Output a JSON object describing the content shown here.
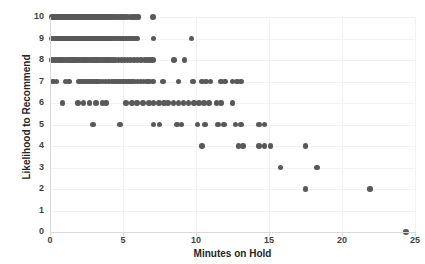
{
  "chart_data": {
    "type": "scatter",
    "title": "",
    "xlabel": "Minutes on Hold",
    "ylabel": "Likelihood to Recommend",
    "xlim": [
      0,
      25
    ],
    "ylim": [
      0,
      10
    ],
    "xticks": [
      0,
      5,
      10,
      15,
      20,
      25
    ],
    "yticks": [
      0,
      1,
      2,
      3,
      4,
      5,
      6,
      7,
      8,
      9,
      10
    ],
    "grid": true,
    "legend": false,
    "marker_color": "#595959",
    "series": [
      {
        "name": "Respondents",
        "points": [
          [
            0.12,
            10
          ],
          [
            0.25,
            10
          ],
          [
            0.35,
            10
          ],
          [
            0.45,
            10
          ],
          [
            0.55,
            10
          ],
          [
            0.65,
            10
          ],
          [
            0.75,
            10
          ],
          [
            0.85,
            10
          ],
          [
            0.95,
            10
          ],
          [
            1.05,
            10
          ],
          [
            1.15,
            10
          ],
          [
            1.25,
            10
          ],
          [
            1.35,
            10
          ],
          [
            1.45,
            10
          ],
          [
            1.55,
            10
          ],
          [
            1.65,
            10
          ],
          [
            1.75,
            10
          ],
          [
            1.85,
            10
          ],
          [
            1.95,
            10
          ],
          [
            2.05,
            10
          ],
          [
            2.15,
            10
          ],
          [
            2.25,
            10
          ],
          [
            2.35,
            10
          ],
          [
            2.45,
            10
          ],
          [
            2.55,
            10
          ],
          [
            2.65,
            10
          ],
          [
            2.75,
            10
          ],
          [
            2.85,
            10
          ],
          [
            2.95,
            10
          ],
          [
            3.05,
            10
          ],
          [
            3.15,
            10
          ],
          [
            3.25,
            10
          ],
          [
            3.35,
            10
          ],
          [
            3.45,
            10
          ],
          [
            3.55,
            10
          ],
          [
            3.65,
            10
          ],
          [
            3.75,
            10
          ],
          [
            3.85,
            10
          ],
          [
            3.95,
            10
          ],
          [
            4.05,
            10
          ],
          [
            4.15,
            10
          ],
          [
            4.25,
            10
          ],
          [
            4.4,
            10
          ],
          [
            4.55,
            10
          ],
          [
            4.7,
            10
          ],
          [
            4.85,
            10
          ],
          [
            5.0,
            10
          ],
          [
            5.15,
            10
          ],
          [
            5.3,
            10
          ],
          [
            5.5,
            10
          ],
          [
            5.7,
            10
          ],
          [
            5.9,
            10
          ],
          [
            6.05,
            10
          ],
          [
            7.05,
            10
          ],
          [
            0.15,
            9
          ],
          [
            0.3,
            9
          ],
          [
            0.4,
            9
          ],
          [
            0.5,
            9
          ],
          [
            0.6,
            9
          ],
          [
            0.7,
            9
          ],
          [
            0.8,
            9
          ],
          [
            0.9,
            9
          ],
          [
            1.0,
            9
          ],
          [
            1.1,
            9
          ],
          [
            1.2,
            9
          ],
          [
            1.3,
            9
          ],
          [
            1.4,
            9
          ],
          [
            1.5,
            9
          ],
          [
            1.6,
            9
          ],
          [
            1.7,
            9
          ],
          [
            1.8,
            9
          ],
          [
            1.9,
            9
          ],
          [
            2.0,
            9
          ],
          [
            2.1,
            9
          ],
          [
            2.2,
            9
          ],
          [
            2.3,
            9
          ],
          [
            2.4,
            9
          ],
          [
            2.5,
            9
          ],
          [
            2.6,
            9
          ],
          [
            2.7,
            9
          ],
          [
            2.8,
            9
          ],
          [
            2.9,
            9
          ],
          [
            3.0,
            9
          ],
          [
            3.1,
            9
          ],
          [
            3.2,
            9
          ],
          [
            3.3,
            9
          ],
          [
            3.4,
            9
          ],
          [
            3.5,
            9
          ],
          [
            3.6,
            9
          ],
          [
            3.7,
            9
          ],
          [
            3.8,
            9
          ],
          [
            3.9,
            9
          ],
          [
            4.0,
            9
          ],
          [
            4.1,
            9
          ],
          [
            4.25,
            9
          ],
          [
            4.45,
            9
          ],
          [
            4.65,
            9
          ],
          [
            4.85,
            9
          ],
          [
            5.0,
            9
          ],
          [
            5.2,
            9
          ],
          [
            5.4,
            9
          ],
          [
            5.6,
            9
          ],
          [
            5.8,
            9
          ],
          [
            5.95,
            9
          ],
          [
            7.1,
            9
          ],
          [
            9.7,
            9
          ],
          [
            0.15,
            8
          ],
          [
            0.3,
            8
          ],
          [
            0.45,
            8
          ],
          [
            0.6,
            8
          ],
          [
            0.75,
            8
          ],
          [
            0.9,
            8
          ],
          [
            1.05,
            8
          ],
          [
            1.2,
            8
          ],
          [
            1.35,
            8
          ],
          [
            1.5,
            8
          ],
          [
            1.65,
            8
          ],
          [
            1.8,
            8
          ],
          [
            1.95,
            8
          ],
          [
            2.1,
            8
          ],
          [
            2.25,
            8
          ],
          [
            2.4,
            8
          ],
          [
            2.55,
            8
          ],
          [
            2.7,
            8
          ],
          [
            2.85,
            8
          ],
          [
            3.0,
            8
          ],
          [
            3.15,
            8
          ],
          [
            3.3,
            8
          ],
          [
            3.45,
            8
          ],
          [
            3.6,
            8
          ],
          [
            3.75,
            8
          ],
          [
            3.9,
            8
          ],
          [
            4.05,
            8
          ],
          [
            4.2,
            8
          ],
          [
            4.35,
            8
          ],
          [
            4.5,
            8
          ],
          [
            4.7,
            8
          ],
          [
            4.9,
            8
          ],
          [
            5.1,
            8
          ],
          [
            5.3,
            8
          ],
          [
            5.5,
            8
          ],
          [
            5.75,
            8
          ],
          [
            6.0,
            8
          ],
          [
            6.25,
            8
          ],
          [
            6.5,
            8
          ],
          [
            6.7,
            8
          ],
          [
            6.9,
            8
          ],
          [
            7.05,
            8
          ],
          [
            8.5,
            8
          ],
          [
            9.2,
            8
          ],
          [
            0.2,
            7
          ],
          [
            0.45,
            7
          ],
          [
            1.05,
            7
          ],
          [
            1.3,
            7
          ],
          [
            2.0,
            7
          ],
          [
            2.2,
            7
          ],
          [
            2.4,
            7
          ],
          [
            2.6,
            7
          ],
          [
            2.8,
            7
          ],
          [
            3.0,
            7
          ],
          [
            3.2,
            7
          ],
          [
            3.4,
            7
          ],
          [
            3.6,
            7
          ],
          [
            3.8,
            7
          ],
          [
            4.0,
            7
          ],
          [
            4.2,
            7
          ],
          [
            4.4,
            7
          ],
          [
            4.6,
            7
          ],
          [
            4.8,
            7
          ],
          [
            5.0,
            7
          ],
          [
            5.2,
            7
          ],
          [
            5.4,
            7
          ],
          [
            5.6,
            7
          ],
          [
            5.8,
            7
          ],
          [
            6.0,
            7
          ],
          [
            6.2,
            7
          ],
          [
            6.4,
            7
          ],
          [
            6.6,
            7
          ],
          [
            6.8,
            7
          ],
          [
            7.05,
            7
          ],
          [
            7.75,
            7
          ],
          [
            8.8,
            7
          ],
          [
            9.8,
            7
          ],
          [
            10.4,
            7
          ],
          [
            10.7,
            7
          ],
          [
            11.0,
            7
          ],
          [
            11.7,
            7
          ],
          [
            12.0,
            7
          ],
          [
            12.5,
            7
          ],
          [
            12.8,
            7
          ],
          [
            13.1,
            7
          ],
          [
            0.85,
            6
          ],
          [
            1.9,
            6
          ],
          [
            2.3,
            6
          ],
          [
            2.7,
            6
          ],
          [
            3.15,
            6
          ],
          [
            3.6,
            6
          ],
          [
            3.85,
            6
          ],
          [
            5.2,
            6
          ],
          [
            5.6,
            6
          ],
          [
            5.95,
            6
          ],
          [
            6.35,
            6
          ],
          [
            6.8,
            6
          ],
          [
            7.1,
            6
          ],
          [
            7.45,
            6
          ],
          [
            7.8,
            6
          ],
          [
            8.1,
            6
          ],
          [
            8.45,
            6
          ],
          [
            8.8,
            6
          ],
          [
            9.15,
            6
          ],
          [
            9.5,
            6
          ],
          [
            9.85,
            6
          ],
          [
            10.2,
            6
          ],
          [
            10.55,
            6
          ],
          [
            10.9,
            6
          ],
          [
            11.4,
            6
          ],
          [
            11.7,
            6
          ],
          [
            12.5,
            6
          ],
          [
            2.95,
            5
          ],
          [
            4.8,
            5
          ],
          [
            7.1,
            5
          ],
          [
            7.5,
            5
          ],
          [
            8.7,
            5
          ],
          [
            9.0,
            5
          ],
          [
            10.1,
            5
          ],
          [
            10.6,
            5
          ],
          [
            11.5,
            5
          ],
          [
            11.9,
            5
          ],
          [
            12.7,
            5
          ],
          [
            13.1,
            5
          ],
          [
            14.3,
            5
          ],
          [
            14.7,
            5
          ],
          [
            10.4,
            4
          ],
          [
            12.9,
            4
          ],
          [
            13.2,
            4
          ],
          [
            14.3,
            4
          ],
          [
            14.7,
            4
          ],
          [
            15.1,
            4
          ],
          [
            17.5,
            4
          ],
          [
            15.8,
            3
          ],
          [
            18.3,
            3
          ],
          [
            17.5,
            2
          ],
          [
            21.9,
            2
          ],
          [
            24.4,
            0
          ]
        ]
      }
    ]
  },
  "axes": {
    "x_title": "Minutes on Hold",
    "y_title": "Likelihood to Recommend",
    "x_tick_labels": [
      "0",
      "5",
      "10",
      "15",
      "20",
      "25"
    ],
    "y_tick_labels": [
      "10",
      "9",
      "8",
      "7",
      "6",
      "5",
      "4",
      "3",
      "2",
      "1",
      "0"
    ]
  }
}
